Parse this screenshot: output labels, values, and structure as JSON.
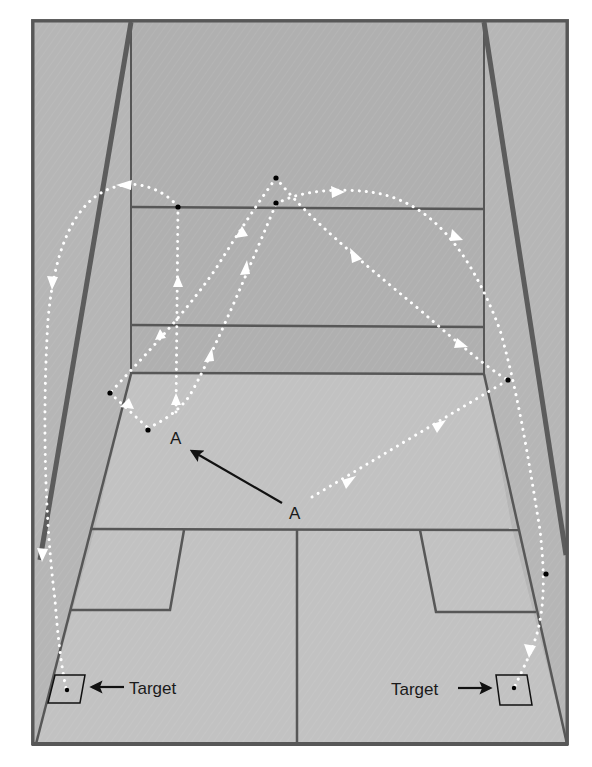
{
  "diagram": {
    "type": "racquetball-court-shot-paths",
    "labels": {
      "player_start": "A",
      "player_end": "A",
      "target_left": "Target",
      "target_right": "Target"
    },
    "colors": {
      "side_wall": "#b4b4b4",
      "front_wall": "#b2b2b2",
      "floor": "#c0c0c0",
      "court_line": "#555555",
      "edge_line": "#5a5a5a",
      "shot_path": "#ffffff",
      "contact_dot": "#000000",
      "label_text": "#1a1a1a"
    },
    "shots": [
      {
        "name": "left-ceiling-around-shot",
        "description": "Ball travels up front wall, arcs over to left side wall and down to left target"
      },
      {
        "name": "right-ceiling-around-shot",
        "description": "Ball travels up front wall, arcs over to right side wall and down to right target"
      },
      {
        "name": "front-wall-pinch-left",
        "description": "Ball hits left side then front wall returning down"
      },
      {
        "name": "cross-court-right",
        "description": "Ball from A goes to right side wall"
      }
    ],
    "player_movement": "A moves toward A (arrow)"
  }
}
